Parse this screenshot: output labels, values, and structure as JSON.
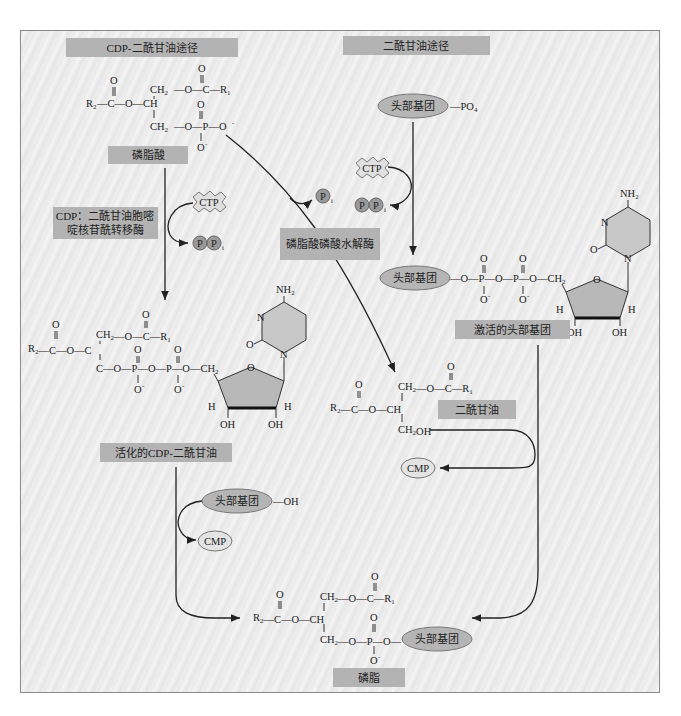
{
  "title_left": "CDP-二酰甘油途径",
  "title_right": "二酰甘油途径",
  "labels": {
    "phosphatidic_acid": "磷脂酸",
    "enzyme_cdp": "CDP：二酰甘油胞嘧",
    "enzyme_cdp_line2": "啶核苷酰转移酶",
    "enzyme_phosphatase": "磷脂酸磷酸水解酶",
    "activated_cdp_dag": "活化的CDP-二酰甘油",
    "activated_head": "激活的头部基团",
    "diacylglycerol": "二酰甘油",
    "phospholipid": "磷脂"
  },
  "molecules": {
    "head_group": "头部基团",
    "po4": "—PO",
    "po4_sub": "4",
    "oh": "—OH",
    "ctp": "CTP",
    "cmp": "CMP",
    "p": "P",
    "i_sub": "i",
    "nh2": "NH",
    "nh2_sub": "2"
  },
  "chem": {
    "r1": "R",
    "r2": "R",
    "o": "O",
    "c": "C",
    "ch": "CH",
    "ch2": "CH",
    "p": "P",
    "o_minus": "O",
    "minus": "-",
    "h": "H",
    "oh": "OH",
    "ch2oh": "CH",
    "n": "N",
    "sub1": "1",
    "sub2": "2"
  }
}
